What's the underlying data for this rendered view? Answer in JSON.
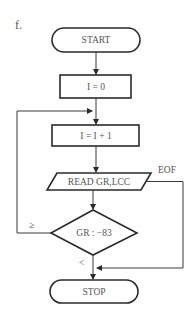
{
  "figure": {
    "label": "f."
  },
  "flowchart": {
    "nodes": [
      {
        "id": "start",
        "type": "terminal",
        "text": "START"
      },
      {
        "id": "init",
        "type": "process",
        "text": "I = 0"
      },
      {
        "id": "increment",
        "type": "process",
        "text": "I = I + 1"
      },
      {
        "id": "read",
        "type": "input-output",
        "text": "READ GR,LCC"
      },
      {
        "id": "compare",
        "type": "decision",
        "text": "GR : −83"
      },
      {
        "id": "stop",
        "type": "terminal",
        "text": "STOP"
      }
    ],
    "edges": [
      {
        "from": "start",
        "to": "init",
        "label": ""
      },
      {
        "from": "init",
        "to": "increment",
        "label": ""
      },
      {
        "from": "increment",
        "to": "read",
        "label": ""
      },
      {
        "from": "read",
        "to": "compare",
        "label": ""
      },
      {
        "from": "read",
        "to": "stop",
        "label": "EOF"
      },
      {
        "from": "compare",
        "to": "increment",
        "label": "≥"
      },
      {
        "from": "compare",
        "to": "stop",
        "label": "<"
      }
    ],
    "edge_labels": {
      "eof": "EOF",
      "ge": "≥",
      "lt": "<"
    }
  }
}
